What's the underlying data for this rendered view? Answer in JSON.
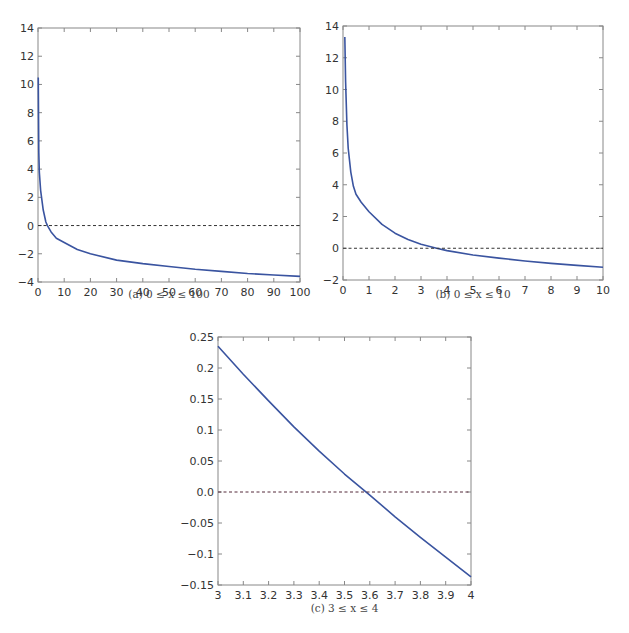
{
  "colors": {
    "curve": "#3a54a0",
    "zero_line": "#333333",
    "zero_line_c": "#552a3a"
  },
  "chart_data": [
    {
      "type": "line",
      "id": "a",
      "title": "",
      "caption": "(a) 0 ≤ x ≤ 100",
      "xlabel": "",
      "ylabel": "",
      "xlim": [
        0,
        100
      ],
      "ylim": [
        -4,
        14
      ],
      "xticks": [
        0,
        10,
        20,
        30,
        40,
        50,
        60,
        70,
        80,
        90,
        100
      ],
      "xtick_labels": [
        "0",
        "10",
        "20",
        "30",
        "40",
        "50",
        "60",
        "70",
        "80",
        "90",
        "100"
      ],
      "yticks": [
        -4,
        -2,
        0,
        2,
        4,
        6,
        8,
        10,
        12,
        14
      ],
      "ytick_labels": [
        "−4",
        "−2",
        "0",
        "2",
        "4",
        "6",
        "8",
        "10",
        "12",
        "14"
      ],
      "grid": false,
      "series": [
        {
          "name": "f(x)",
          "style": "solid",
          "x": [
            0.1,
            0.3,
            0.5,
            1,
            2,
            3,
            3.6,
            5,
            7,
            10,
            15,
            20,
            30,
            40,
            50,
            60,
            70,
            80,
            90,
            100
          ],
          "y": [
            10.5,
            5.2,
            3.8,
            2.5,
            1.1,
            0.25,
            0.0,
            -0.45,
            -0.9,
            -1.2,
            -1.7,
            -2.0,
            -2.45,
            -2.7,
            -2.9,
            -3.1,
            -3.25,
            -3.4,
            -3.5,
            -3.6
          ]
        },
        {
          "name": "zero",
          "style": "dashed",
          "x": [
            0,
            100
          ],
          "y": [
            0,
            0
          ]
        }
      ]
    },
    {
      "type": "line",
      "id": "b",
      "title": "",
      "caption": "(b) 0 ≤ x ≤ 10",
      "xlabel": "",
      "ylabel": "",
      "xlim": [
        0,
        10
      ],
      "ylim": [
        -2,
        14
      ],
      "xticks": [
        0,
        1,
        2,
        3,
        4,
        5,
        6,
        7,
        8,
        9,
        10
      ],
      "xtick_labels": [
        "0",
        "1",
        "2",
        "3",
        "4",
        "5",
        "6",
        "7",
        "8",
        "9",
        "10"
      ],
      "yticks": [
        -2,
        0,
        2,
        4,
        6,
        8,
        10,
        12,
        14
      ],
      "ytick_labels": [
        "−2",
        "0",
        "2",
        "4",
        "6",
        "8",
        "10",
        "12",
        "14"
      ],
      "grid": false,
      "series": [
        {
          "name": "f(x)",
          "style": "solid",
          "x": [
            0.07,
            0.1,
            0.15,
            0.2,
            0.3,
            0.4,
            0.5,
            0.7,
            1,
            1.5,
            2,
            2.5,
            3,
            3.6,
            4,
            5,
            6,
            7,
            8,
            9,
            10
          ],
          "y": [
            13.3,
            10.5,
            7.8,
            6.3,
            4.8,
            3.9,
            3.4,
            2.9,
            2.3,
            1.5,
            0.95,
            0.55,
            0.25,
            0.0,
            -0.15,
            -0.42,
            -0.62,
            -0.8,
            -0.95,
            -1.08,
            -1.2
          ]
        },
        {
          "name": "zero",
          "style": "dashed",
          "x": [
            0,
            10
          ],
          "y": [
            0,
            0
          ]
        }
      ]
    },
    {
      "type": "line",
      "id": "c",
      "title": "",
      "caption": "(c) 3 ≤ x ≤ 4",
      "xlabel": "",
      "ylabel": "",
      "xlim": [
        3,
        4
      ],
      "ylim": [
        -0.15,
        0.25
      ],
      "xticks": [
        3,
        3.1,
        3.2,
        3.3,
        3.4,
        3.5,
        3.6,
        3.7,
        3.8,
        3.9,
        4
      ],
      "xtick_labels": [
        "3",
        "3.1",
        "3.2",
        "3.3",
        "3.4",
        "3.5",
        "3.6",
        "3.7",
        "3.8",
        "3.9",
        "4"
      ],
      "yticks": [
        -0.15,
        -0.1,
        -0.05,
        0.0,
        0.05,
        0.1,
        0.15,
        0.2,
        0.25
      ],
      "ytick_labels": [
        "−0.15",
        "−0.1",
        "−0.05",
        "0.0",
        "0.05",
        "0.1",
        "0.15",
        "0.2",
        "0.25"
      ],
      "grid": false,
      "series": [
        {
          "name": "f(x)",
          "style": "solid",
          "x": [
            3.0,
            3.1,
            3.2,
            3.3,
            3.4,
            3.5,
            3.6,
            3.7,
            3.8,
            3.9,
            4.0
          ],
          "y": [
            0.235,
            0.19,
            0.147,
            0.105,
            0.066,
            0.029,
            -0.005,
            -0.04,
            -0.073,
            -0.105,
            -0.137
          ]
        },
        {
          "name": "zero",
          "style": "dashed",
          "x": [
            3,
            4
          ],
          "y": [
            0,
            0
          ]
        }
      ]
    }
  ]
}
